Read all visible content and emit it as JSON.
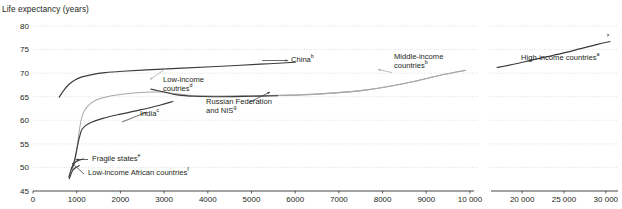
{
  "chart_data": {
    "type": "line",
    "title": "",
    "ylabel": "Life expectancy (years)",
    "xlabel": "",
    "ylim": [
      45,
      80
    ],
    "yticks": [
      45,
      50,
      55,
      60,
      65,
      70,
      75,
      80
    ],
    "ytick_labels": [
      "45",
      "50",
      "55",
      "60",
      "65",
      "70",
      "75",
      "80"
    ],
    "xticks_main": [
      0,
      1000,
      2000,
      3000,
      4000,
      5000,
      6000,
      7000,
      8000,
      9000,
      10000
    ],
    "xtick_labels_main": [
      "0",
      "1000",
      "2000",
      "3000",
      "4000",
      "5000",
      "6000",
      "7000",
      "8000",
      "9000",
      "10 000"
    ],
    "xticks_break": [
      20000,
      25000,
      30000
    ],
    "xtick_labels_break": [
      "20 000",
      "25 000",
      "30 000"
    ],
    "axis_break": true,
    "grid": "horizontal-dotted",
    "legend": "inline-annotations",
    "series": [
      {
        "name": "China",
        "superscript": "b",
        "color": "#3b3b3b",
        "style": "dark",
        "points": [
          [
            600,
            64.9
          ],
          [
            700,
            66.3
          ],
          [
            820,
            67.6
          ],
          [
            950,
            68.5
          ],
          [
            1120,
            69.2
          ],
          [
            1350,
            69.7
          ],
          [
            1650,
            70.1
          ],
          [
            2050,
            70.4
          ],
          [
            2600,
            70.7
          ],
          [
            3300,
            71.0
          ],
          [
            4200,
            71.4
          ],
          [
            5200,
            71.9
          ],
          [
            6000,
            72.3
          ]
        ]
      },
      {
        "name": "Low-income coutries",
        "superscript": "d",
        "color": "#a8a8a8",
        "style": "light",
        "points": [
          [
            900,
            49.5
          ],
          [
            950,
            51.0
          ],
          [
            1000,
            53.5
          ],
          [
            1040,
            56.5
          ],
          [
            1080,
            59.0
          ],
          [
            1140,
            61.3
          ],
          [
            1250,
            63.0
          ],
          [
            1450,
            64.3
          ],
          [
            1800,
            65.2
          ],
          [
            2300,
            65.8
          ],
          [
            2900,
            66.0
          ],
          [
            3300,
            65.6
          ],
          [
            3700,
            65.2
          ],
          [
            4200,
            65.1
          ],
          [
            5200,
            65.2
          ],
          [
            6400,
            65.5
          ],
          [
            7600,
            66.4
          ],
          [
            8600,
            68.0
          ],
          [
            9300,
            69.5
          ],
          [
            9900,
            70.6
          ]
        ]
      },
      {
        "name": "Middle-income countries",
        "superscript": "b",
        "color": "#a8a8a8",
        "style": "light",
        "points": [
          [
            3700,
            65.2
          ],
          [
            4200,
            65.1
          ],
          [
            5200,
            65.2
          ],
          [
            6400,
            65.5
          ],
          [
            7600,
            66.4
          ],
          [
            8600,
            68.0
          ],
          [
            9300,
            69.5
          ],
          [
            9900,
            70.6
          ]
        ]
      },
      {
        "name": "India",
        "superscript": "c",
        "color": "#3b3b3b",
        "style": "dark",
        "points": [
          [
            880,
            49.6
          ],
          [
            950,
            51.5
          ],
          [
            1000,
            53.8
          ],
          [
            1060,
            56.3
          ],
          [
            1130,
            58.2
          ],
          [
            1300,
            59.4
          ],
          [
            1600,
            60.4
          ],
          [
            2000,
            61.3
          ],
          [
            2450,
            62.2
          ],
          [
            2900,
            63.2
          ],
          [
            3200,
            64.0
          ]
        ]
      },
      {
        "name": "Russian Federation and NIS",
        "superscript": "g",
        "color": "#3b3b3b",
        "style": "dark",
        "points": [
          [
            2700,
            66.6
          ],
          [
            3000,
            66.0
          ],
          [
            3300,
            65.4
          ],
          [
            3700,
            65.1
          ],
          [
            4300,
            65.0
          ],
          [
            5000,
            65.1
          ],
          [
            5600,
            65.2
          ]
        ]
      },
      {
        "name": "Fragile states",
        "superscript": "e",
        "color": "#3b3b3b",
        "style": "dark",
        "points": [
          [
            820,
            48.0
          ],
          [
            860,
            49.2
          ],
          [
            900,
            50.2
          ],
          [
            960,
            51.0
          ],
          [
            1040,
            51.5
          ],
          [
            1150,
            51.8
          ]
        ]
      },
      {
        "name": "Low-income African countries",
        "superscript": "f",
        "color": "#3b3b3b",
        "style": "dark",
        "points": [
          [
            830,
            47.6
          ],
          [
            870,
            48.6
          ],
          [
            910,
            49.4
          ],
          [
            980,
            50.0
          ],
          [
            1060,
            50.4
          ]
        ]
      },
      {
        "name": "High-income countries",
        "superscript": "a",
        "color": "#3b3b3b",
        "style": "dark",
        "points": [
          [
            17000,
            71.2
          ],
          [
            19000,
            71.9
          ],
          [
            21000,
            72.7
          ],
          [
            23000,
            73.5
          ],
          [
            25000,
            74.3
          ],
          [
            27000,
            75.2
          ],
          [
            29000,
            76.1
          ],
          [
            30500,
            76.7
          ]
        ]
      }
    ],
    "annotations": [
      {
        "id": "china",
        "text": "China",
        "sup": "b"
      },
      {
        "id": "low-income",
        "text": "Low-income\ncoutries",
        "sup": "d"
      },
      {
        "id": "middle-income",
        "text": "Middle-income\ncountries",
        "sup": "b"
      },
      {
        "id": "russia",
        "text": "Russian Federation\nand NIS",
        "sup": "g"
      },
      {
        "id": "india",
        "text": "India",
        "sup": "c"
      },
      {
        "id": "fragile",
        "text": "Fragile states",
        "sup": "e"
      },
      {
        "id": "africa",
        "text": "Low-income African countries",
        "sup": "f"
      },
      {
        "id": "high-income",
        "text": "High-income countries",
        "sup": "a"
      }
    ]
  },
  "labels": {
    "axis_title": "Life expectancy (years)",
    "china": "China",
    "china_sup": "b",
    "low_income_line1": "Low-income",
    "low_income_line2": "coutries",
    "low_income_sup": "d",
    "middle_income_line1": "Middle-income",
    "middle_income_line2": "countries",
    "middle_income_sup": "b",
    "russia_line1": "Russian Federation",
    "russia_line2": "and NIS",
    "russia_sup": "g",
    "india": "India",
    "india_sup": "c",
    "fragile": "Fragile states",
    "fragile_sup": "e",
    "africa": "Low-income African countries",
    "africa_sup": "f",
    "high_income": "High-income countries",
    "high_income_sup": "a"
  },
  "colors": {
    "dark_series": "#3b3b3b",
    "light_series": "#a8a8a8",
    "grid": "#c9c9c9",
    "axis": "#231f20",
    "text": "#231f20",
    "background": "#ffffff"
  }
}
